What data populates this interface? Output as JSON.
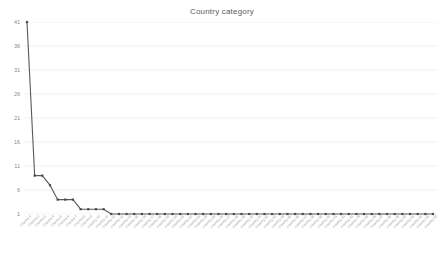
{
  "chart": {
    "title": "Country category"
  },
  "chart_data": {
    "type": "line",
    "title": "Country category",
    "xlabel": "",
    "ylabel": "",
    "ylim": [
      1,
      41
    ],
    "yticks": [
      1,
      6,
      11,
      16,
      21,
      26,
      31,
      36,
      41
    ],
    "grid": true,
    "legend": false,
    "marker": "square",
    "line_color": "#595959",
    "marker_color": "#4a4a4a",
    "grid_color": "#e8e8e8",
    "categories": [
      "Country 1",
      "Country 2",
      "Country 3",
      "Country 4",
      "Country 5",
      "Country 6",
      "Country 7",
      "Country 8",
      "Country 9",
      "Country 10",
      "Country 11",
      "Country 12",
      "Country 13",
      "Country 14",
      "Country 15",
      "Country 16",
      "Country 17",
      "Country 18",
      "Country 19",
      "Country 20",
      "Country 21",
      "Country 22",
      "Country 23",
      "Country 24",
      "Country 25",
      "Country 26",
      "Country 27",
      "Country 28",
      "Country 29",
      "Country 30",
      "Country 31",
      "Country 32",
      "Country 33",
      "Country 34",
      "Country 35",
      "Country 36",
      "Country 37",
      "Country 38",
      "Country 39",
      "Country 40",
      "Country 41",
      "Country 42",
      "Country 43",
      "Country 44",
      "Country 45",
      "Country 46",
      "Country 47",
      "Country 48",
      "Country 49",
      "Country 50",
      "Country 51",
      "Country 52",
      "Country 53",
      "Country 54"
    ],
    "values": [
      41,
      9,
      9,
      7,
      4,
      4,
      4,
      2,
      2,
      2,
      2,
      1,
      1,
      1,
      1,
      1,
      1,
      1,
      1,
      1,
      1,
      1,
      1,
      1,
      1,
      1,
      1,
      1,
      1,
      1,
      1,
      1,
      1,
      1,
      1,
      1,
      1,
      1,
      1,
      1,
      1,
      1,
      1,
      1,
      1,
      1,
      1,
      1,
      1,
      1,
      1,
      1,
      1,
      1
    ]
  }
}
